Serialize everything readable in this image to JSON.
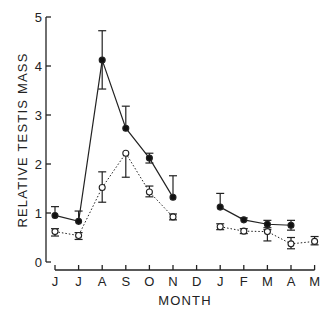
{
  "chart_data": {
    "type": "line",
    "title": "",
    "xlabel": "MONTH",
    "ylabel": "RELATIVE TESTIS MASS",
    "ylim": [
      0,
      5
    ],
    "yticks": [
      0,
      1,
      2,
      3,
      4,
      5
    ],
    "grid": false,
    "legend": null,
    "categories": [
      "J",
      "J",
      "A",
      "S",
      "O",
      "N",
      "D",
      "J",
      "F",
      "M",
      "A",
      "M"
    ],
    "series": [
      {
        "name": "filled circles (solid line)",
        "marker": "filled-circle",
        "line": "solid",
        "values": [
          0.95,
          0.83,
          4.12,
          2.73,
          2.12,
          1.32,
          null,
          1.12,
          0.86,
          0.77,
          0.75,
          null
        ],
        "error_upper": [
          1.13,
          1.04,
          4.72,
          3.18,
          2.22,
          1.76,
          null,
          1.4,
          0.9,
          0.85,
          0.85,
          null
        ],
        "error_lower": [
          null,
          null,
          3.53,
          null,
          2.02,
          null,
          null,
          null,
          null,
          0.7,
          0.65,
          null
        ]
      },
      {
        "name": "open circles (dotted line)",
        "marker": "open-circle",
        "line": "dotted",
        "values": [
          0.62,
          0.54,
          1.52,
          2.22,
          1.43,
          0.92,
          null,
          0.72,
          0.63,
          0.62,
          0.37,
          0.42
        ],
        "error_upper": [
          0.68,
          0.6,
          1.84,
          null,
          1.55,
          0.98,
          null,
          0.78,
          0.68,
          0.66,
          0.5,
          0.52
        ],
        "error_lower": [
          0.53,
          0.46,
          1.22,
          1.73,
          1.33,
          0.86,
          null,
          0.66,
          0.58,
          0.43,
          0.27,
          0.35
        ]
      }
    ]
  },
  "axes": {
    "y_tick_labels": [
      "0",
      "1",
      "2",
      "3",
      "4",
      "5"
    ],
    "x_tick_labels": [
      "J",
      "J",
      "A",
      "S",
      "O",
      "N",
      "D",
      "J",
      "F",
      "M",
      "A",
      "M"
    ]
  }
}
